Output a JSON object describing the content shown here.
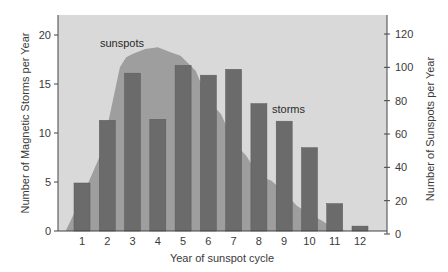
{
  "chart_data": {
    "type": "bar",
    "title": "",
    "xlabel": "Year of sunspot cycle",
    "ylabel": "Number of Magnetic Storms per Year",
    "ylabel_right": "Number of Sunspots per Year",
    "categories": [
      "1",
      "2",
      "3",
      "4",
      "5",
      "6",
      "7",
      "8",
      "9",
      "10",
      "11",
      "12"
    ],
    "series": [
      {
        "name": "storms",
        "type": "bar",
        "axis": "left",
        "values": [
          4.9,
          11.3,
          16.1,
          11.4,
          16.9,
          15.9,
          16.5,
          13.0,
          11.2,
          8.5,
          2.8,
          0.5
        ]
      },
      {
        "name": "sunspots",
        "type": "area",
        "axis": "right",
        "points": [
          [
            0.35,
            0
          ],
          [
            1.0,
            22
          ],
          [
            1.8,
            50
          ],
          [
            2.5,
            100
          ],
          [
            2.75,
            106
          ],
          [
            3.0,
            108
          ],
          [
            3.5,
            111
          ],
          [
            4.0,
            112
          ],
          [
            4.5,
            109
          ],
          [
            4.9,
            107
          ],
          [
            5.5,
            98
          ],
          [
            6.0,
            80
          ],
          [
            6.5,
            72
          ],
          [
            7.0,
            55
          ],
          [
            7.5,
            47
          ],
          [
            8.0,
            35
          ],
          [
            8.5,
            32
          ],
          [
            9.0,
            25
          ],
          [
            9.5,
            17
          ],
          [
            10.0,
            12
          ],
          [
            10.5,
            8
          ],
          [
            11.0,
            3
          ],
          [
            11.5,
            1
          ],
          [
            12.0,
            0.5
          ],
          [
            12.3,
            0
          ]
        ]
      }
    ],
    "yticks_left": [
      0,
      5,
      10,
      15,
      20
    ],
    "yticks_right": [
      0,
      20,
      40,
      60,
      80,
      100,
      120
    ],
    "ylim": [
      0,
      22
    ],
    "ylim_right": [
      0,
      129
    ],
    "grid": false,
    "legend": "none (inline labels)",
    "annotations": [
      {
        "text": "sunspots",
        "near_x": 4,
        "near_y_right": 115
      },
      {
        "text": "storms",
        "near_x": 8.5,
        "near_y_left": 12.7
      }
    ],
    "colors": {
      "plot_bg": "#d9d9d9",
      "sunspot_fill": "#9e9e9e",
      "bar_fill": "#6b6b6b",
      "bar_stroke": "#5a5a5a"
    }
  },
  "labels": {
    "xlabel": "Year of sunspot cycle",
    "ylabel_left": "Number of Magnetic Storms per Year",
    "ylabel_right": "Number of Sunspots per Year",
    "annot_sunspots": "sunspots",
    "annot_storms": "storms"
  }
}
